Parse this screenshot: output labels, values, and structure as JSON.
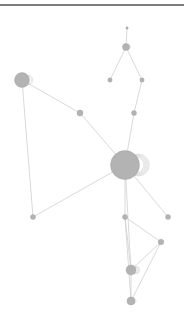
{
  "graph": {
    "header_line_color": "#7d7d7d",
    "edge_color": "#cfcfcf",
    "node_fill": "#b3b3b3",
    "node_stroke": "#9e9e9e",
    "loop_color": "#d4d4d4",
    "nodes": [
      {
        "id": "n1",
        "x": 127,
        "y": 28,
        "r": 1.2,
        "loops": 0
      },
      {
        "id": "n2",
        "x": 126,
        "y": 47,
        "r": 3.5,
        "loops": 1
      },
      {
        "id": "n3",
        "x": 110,
        "y": 80,
        "r": 2.2,
        "loops": 0
      },
      {
        "id": "n4",
        "x": 142,
        "y": 80,
        "r": 2.2,
        "loops": 0
      },
      {
        "id": "n5",
        "x": 22,
        "y": 80,
        "r": 7.5,
        "loops": 2
      },
      {
        "id": "n6",
        "x": 80,
        "y": 113,
        "r": 3,
        "loops": 0
      },
      {
        "id": "n7",
        "x": 134,
        "y": 113,
        "r": 2.5,
        "loops": 0
      },
      {
        "id": "n8",
        "x": 125,
        "y": 165,
        "r": 14.5,
        "loops": 6
      },
      {
        "id": "n9",
        "x": 33,
        "y": 217,
        "r": 2.5,
        "loops": 0
      },
      {
        "id": "n10",
        "x": 125,
        "y": 217,
        "r": 2.5,
        "loops": 0
      },
      {
        "id": "n11",
        "x": 168,
        "y": 217,
        "r": 2.5,
        "loops": 0
      },
      {
        "id": "n12",
        "x": 161,
        "y": 242,
        "r": 2.8,
        "loops": 0
      },
      {
        "id": "n13",
        "x": 131,
        "y": 270,
        "r": 5,
        "loops": 3
      },
      {
        "id": "n14",
        "x": 131,
        "y": 301,
        "r": 4,
        "loops": 1
      }
    ],
    "edges": [
      [
        "n1",
        "n2"
      ],
      [
        "n2",
        "n3"
      ],
      [
        "n2",
        "n4"
      ],
      [
        "n4",
        "n7"
      ],
      [
        "n7",
        "n8"
      ],
      [
        "n5",
        "n6"
      ],
      [
        "n6",
        "n8"
      ],
      [
        "n5",
        "n9"
      ],
      [
        "n9",
        "n8"
      ],
      [
        "n8",
        "n10"
      ],
      [
        "n8",
        "n11"
      ],
      [
        "n10",
        "n12"
      ],
      [
        "n10",
        "n13"
      ],
      [
        "n10",
        "n14"
      ],
      [
        "n12",
        "n13"
      ],
      [
        "n12",
        "n14"
      ],
      [
        "n13",
        "n14"
      ],
      [
        "n8",
        "n13"
      ]
    ]
  }
}
